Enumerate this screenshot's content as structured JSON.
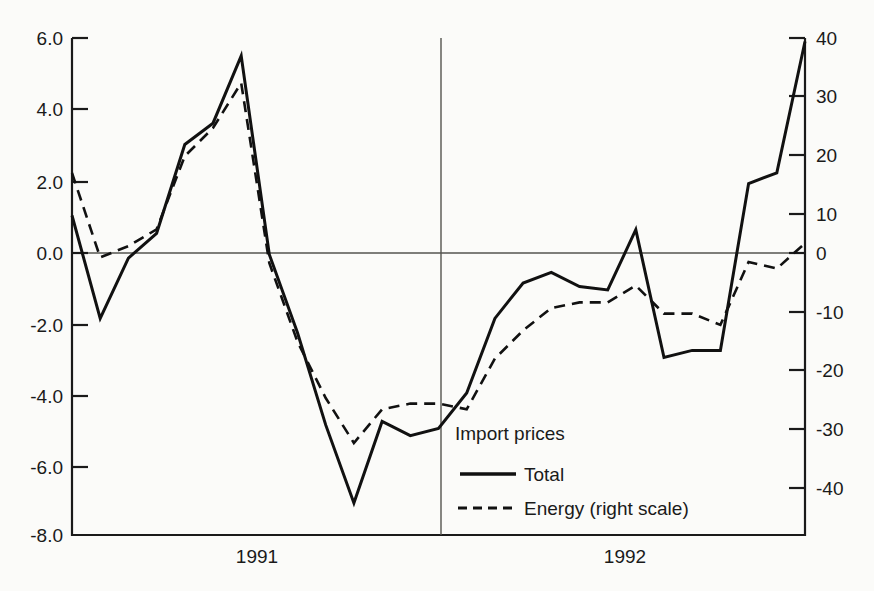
{
  "chart_data": {
    "type": "line",
    "title": "",
    "subtitle": "",
    "xlabel": "",
    "ylabel": "",
    "grid": false,
    "legend_position": "inside-bottom-center",
    "legend_title": "Import prices",
    "x_tick_labels": [
      "1991",
      "1992"
    ],
    "x_period_divider": "between 1991 and 1992",
    "left_axis": {
      "label": "",
      "ticks": [
        "6.0",
        "4.0",
        "2.0",
        "0.0",
        "-2.0",
        "-4.0",
        "-6.0",
        "-8.0"
      ],
      "tick_values": [
        6.0,
        4.0,
        2.0,
        0.0,
        -2.0,
        -4.0,
        -6.0,
        -8.0
      ],
      "ylim": [
        -8.0,
        6.0
      ]
    },
    "right_axis": {
      "label": "right scale",
      "ticks": [
        "40",
        "30",
        "20",
        "10",
        "0",
        "-10",
        "-20",
        "-30",
        "-40"
      ],
      "tick_values": [
        40,
        30,
        20,
        10,
        0,
        -10,
        -20,
        -30,
        -40
      ],
      "ylim": [
        -48,
        40
      ]
    },
    "x": [
      1,
      2,
      3,
      4,
      5,
      6,
      7,
      8,
      9,
      10,
      11,
      12,
      13,
      14,
      15,
      16,
      17,
      18,
      19,
      20,
      21,
      22,
      23,
      24
    ],
    "series": [
      {
        "name": "Total",
        "axis": "left",
        "style": "solid",
        "values": [
          1.0,
          -1.9,
          -0.2,
          0.5,
          3.0,
          3.6,
          5.5,
          -0.1,
          -2.3,
          -4.9,
          -7.1,
          -4.8,
          -5.2,
          -5.0,
          -4.0,
          -1.9,
          -0.9,
          -0.6,
          -1.0,
          -1.1,
          0.6,
          -3.0,
          -2.8,
          -2.8
        ]
      },
      {
        "name": "Energy (right scale)",
        "axis": "right",
        "style": "dashed",
        "values": [
          16,
          1,
          3,
          6,
          19,
          24,
          32,
          0,
          -14,
          -24,
          -32,
          -26,
          -25,
          -25,
          -26,
          -17,
          -12,
          -8,
          -7,
          -7,
          -4,
          -9,
          -9,
          -11
        ]
      }
    ],
    "series_extension": {
      "note": "last four months of 1992 rise sharply",
      "total_tail": [
        1.9,
        2.2,
        5.9
      ],
      "energy_tail": [
        0.2,
        -1.0,
        3.5
      ]
    }
  },
  "legend": {
    "title": "Import prices",
    "entries": [
      {
        "label": "Total",
        "style": "solid"
      },
      {
        "label": "Energy (right scale)",
        "style": "dashed"
      }
    ]
  },
  "axes": {
    "left_ticks": [
      "6.0",
      "4.0",
      "2.0",
      "0.0",
      "-2.0",
      "-4.0",
      "-6.0",
      "-8.0"
    ],
    "right_ticks": [
      "40",
      "30",
      "20",
      "10",
      "0",
      "-10",
      "-20",
      "-30",
      "-40"
    ],
    "x_ticks": [
      "1991",
      "1992"
    ]
  }
}
